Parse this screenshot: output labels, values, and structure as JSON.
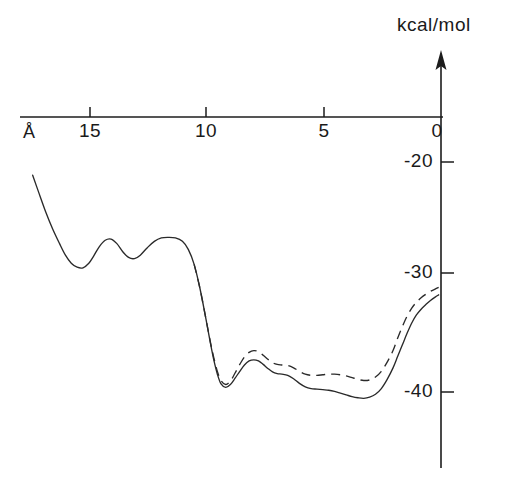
{
  "chart_data": {
    "type": "line",
    "title": "",
    "subtitle": "",
    "xlabel": "Å",
    "ylabel": "kcal/mol",
    "xlim": [
      18.4,
      -0.2
    ],
    "ylim": [
      -44.5,
      -17.0
    ],
    "x_axis_reversed": true,
    "grid": false,
    "legend_position": "none",
    "x_ticks": [
      {
        "value": 15,
        "label": "15"
      },
      {
        "value": 10,
        "label": "10"
      },
      {
        "value": 5,
        "label": "5"
      },
      {
        "value": 0,
        "label": "0"
      }
    ],
    "y_ticks": [
      {
        "value": -20,
        "label": "-20"
      },
      {
        "value": -30,
        "label": "-30"
      },
      {
        "value": -40,
        "label": "-40"
      }
    ],
    "series": [
      {
        "name": "solid-curve",
        "style": "solid",
        "color": "#2a2a2a",
        "x": [
          17.45,
          17.2,
          16.9,
          16.6,
          16.3,
          16.05,
          15.8,
          15.55,
          15.3,
          15.05,
          14.85,
          14.6,
          14.35,
          14.1,
          13.85,
          13.6,
          13.35,
          13.1,
          12.85,
          12.55,
          12.25,
          11.95,
          11.65,
          11.35,
          11.05,
          10.8,
          10.55,
          10.3,
          10.05,
          9.85,
          9.7,
          9.55,
          9.4,
          9.2,
          9.0,
          8.8,
          8.6,
          8.4,
          8.2,
          8.0,
          7.8,
          7.6,
          7.4,
          7.2,
          7.0,
          6.8,
          6.55,
          6.3,
          6.05,
          5.8,
          5.55,
          5.3,
          5.05,
          4.8,
          4.55,
          4.3,
          4.05,
          3.8,
          3.55,
          3.3,
          3.05,
          2.8,
          2.55,
          2.3,
          2.05,
          1.85,
          1.65,
          1.45,
          1.25,
          1.05,
          0.85,
          0.65,
          0.45,
          0.25,
          0.1
        ],
        "y": [
          -21.15,
          -22.6,
          -24.3,
          -25.8,
          -27.1,
          -28.1,
          -28.8,
          -29.15,
          -29.2,
          -28.8,
          -28.2,
          -27.35,
          -26.8,
          -26.7,
          -27.1,
          -27.8,
          -28.3,
          -28.4,
          -28.1,
          -27.45,
          -26.9,
          -26.6,
          -26.55,
          -26.6,
          -26.9,
          -27.6,
          -28.9,
          -31.0,
          -33.6,
          -35.8,
          -37.3,
          -38.5,
          -39.3,
          -39.6,
          -39.35,
          -38.8,
          -38.2,
          -37.65,
          -37.3,
          -37.2,
          -37.3,
          -37.6,
          -37.95,
          -38.25,
          -38.4,
          -38.45,
          -38.55,
          -38.85,
          -39.25,
          -39.55,
          -39.7,
          -39.75,
          -39.8,
          -39.85,
          -39.95,
          -40.1,
          -40.25,
          -40.4,
          -40.5,
          -40.55,
          -40.45,
          -40.2,
          -39.7,
          -38.9,
          -37.9,
          -36.9,
          -35.9,
          -34.9,
          -34.0,
          -33.3,
          -32.8,
          -32.4,
          -32.05,
          -31.75,
          -31.55
        ]
      },
      {
        "name": "dashed-curve",
        "style": "dashed",
        "color": "#2a2a2a",
        "x": [
          10.55,
          10.3,
          10.05,
          9.85,
          9.7,
          9.55,
          9.4,
          9.2,
          9.0,
          8.8,
          8.6,
          8.4,
          8.2,
          8.0,
          7.8,
          7.6,
          7.4,
          7.2,
          7.0,
          6.8,
          6.55,
          6.3,
          6.05,
          5.8,
          5.55,
          5.3,
          5.05,
          4.8,
          4.55,
          4.3,
          4.05,
          3.8,
          3.55,
          3.3,
          3.05,
          2.8,
          2.55,
          2.3,
          2.05,
          1.85,
          1.65,
          1.45,
          1.25,
          1.05,
          0.85,
          0.65,
          0.45,
          0.25,
          0.1
        ],
        "y": [
          -28.9,
          -31.0,
          -33.6,
          -35.7,
          -37.1,
          -38.25,
          -39.0,
          -39.35,
          -39.05,
          -38.35,
          -37.6,
          -36.95,
          -36.55,
          -36.4,
          -36.5,
          -36.8,
          -37.15,
          -37.45,
          -37.6,
          -37.65,
          -37.7,
          -37.9,
          -38.2,
          -38.45,
          -38.55,
          -38.55,
          -38.5,
          -38.45,
          -38.45,
          -38.5,
          -38.6,
          -38.75,
          -38.9,
          -39.0,
          -38.95,
          -38.7,
          -38.2,
          -37.4,
          -36.4,
          -35.3,
          -34.3,
          -33.4,
          -32.7,
          -32.2,
          -31.8,
          -31.5,
          -31.25,
          -31.05,
          -30.9
        ]
      }
    ],
    "annotations": []
  },
  "axes": {
    "x_unit_label": "Å",
    "y_unit_label": "kcal/mol",
    "x_tick_labels": [
      "15",
      "10",
      "5",
      "0"
    ],
    "y_tick_labels": [
      "-20",
      "-30",
      "-40"
    ]
  }
}
